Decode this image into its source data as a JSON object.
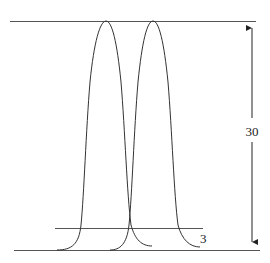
{
  "diagram": {
    "type": "two-overlapping-peaks",
    "labels": {
      "height": "30",
      "threshold": "3"
    },
    "colors": {
      "stroke": "#333333",
      "background": "#ffffff"
    }
  }
}
